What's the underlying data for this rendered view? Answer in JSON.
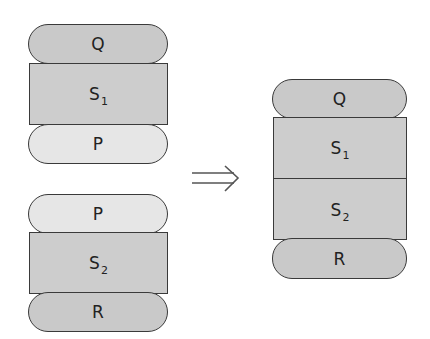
{
  "left_top_stack": {
    "top_pill": {
      "label": "Q"
    },
    "middle_rect": {
      "label": "S",
      "subscript": "1"
    },
    "bottom_pill": {
      "label": "P"
    }
  },
  "left_bottom_stack": {
    "top_pill": {
      "label": "P"
    },
    "middle_rect": {
      "label": "S",
      "subscript": "2"
    },
    "bottom_pill": {
      "label": "R"
    }
  },
  "arrow": {
    "icon": "double-arrow-right-icon",
    "symbol": "⟹"
  },
  "right_stack": {
    "top_pill": {
      "label": "Q"
    },
    "rect_upper": {
      "label": "S",
      "subscript": "1"
    },
    "rect_lower": {
      "label": "S",
      "subscript": "2"
    },
    "bottom_pill": {
      "label": "R"
    }
  },
  "colors": {
    "outline": "#3a3a3a",
    "dark_fill": "#c9c9c9",
    "light_fill": "#e6e6e6",
    "rect_fill": "#cdcdcd"
  }
}
